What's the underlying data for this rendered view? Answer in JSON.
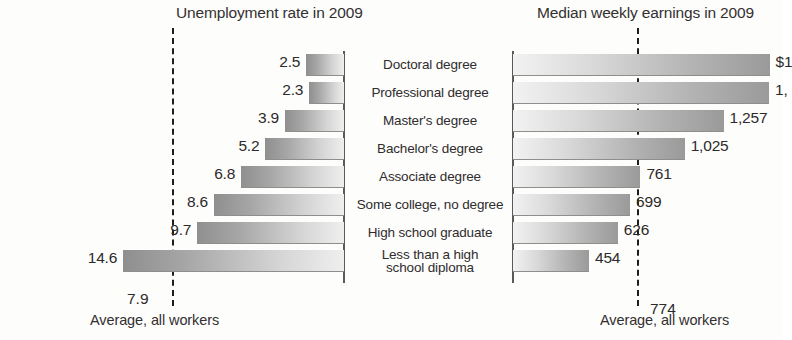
{
  "chart_data": [
    {
      "type": "bar",
      "title": "Unemployment rate in 2009",
      "orientation": "horizontal",
      "direction": "right-to-left",
      "xlabel": "",
      "ylabel": "",
      "grid": false,
      "legend": null,
      "xlim": [
        0,
        16
      ],
      "categories": [
        "Doctoral degree",
        "Professional degree",
        "Master's degree",
        "Bachelor's degree",
        "Associate degree",
        "Some college, no degree",
        "High school graduate",
        "Less than a high school diploma"
      ],
      "values": [
        2.5,
        2.3,
        3.9,
        5.2,
        6.8,
        8.6,
        9.7,
        14.6
      ],
      "value_labels": [
        "2.5",
        "2.3",
        "3.9",
        "5.2",
        "6.8",
        "8.6",
        "9.7",
        "14.6"
      ],
      "reference_line": {
        "value": 7.9,
        "label": "7.9",
        "caption": "Average, all workers",
        "style": "dashed"
      }
    },
    {
      "type": "bar",
      "title": "Median weekly earnings in 2009",
      "orientation": "horizontal",
      "direction": "left-to-right",
      "xlabel": "",
      "ylabel": "",
      "grid": false,
      "legend": null,
      "xlim": [
        0,
        1600
      ],
      "categories": [
        "Doctoral degree",
        "Professional degree",
        "Master's degree",
        "Bachelor's degree",
        "Associate degree",
        "Some college, no degree",
        "High school graduate",
        "Less than a high school diploma"
      ],
      "values": [
        1532,
        1529,
        1257,
        1025,
        761,
        699,
        626,
        454
      ],
      "value_labels": [
        "$1",
        "1,",
        "1,257",
        "1,025",
        "761",
        "699",
        "626",
        "454"
      ],
      "value_labels_note": "first two labels are clipped by the right edge of the screenshot",
      "reference_line": {
        "value": 774,
        "label": "774",
        "caption": "Average, all workers",
        "style": "dashed"
      }
    }
  ],
  "left_chart": {
    "title": "Unemployment rate in 2009",
    "bars": [
      {
        "label": "2.5",
        "value": 2.5
      },
      {
        "label": "2.3",
        "value": 2.3
      },
      {
        "label": "3.9",
        "value": 3.9
      },
      {
        "label": "5.2",
        "value": 5.2
      },
      {
        "label": "6.8",
        "value": 6.8
      },
      {
        "label": "8.6",
        "value": 8.6
      },
      {
        "label": "9.7",
        "value": 9.7
      },
      {
        "label": "14.6",
        "value": 14.6
      }
    ],
    "average_value": "7.9",
    "average_caption": "Average, all workers"
  },
  "right_chart": {
    "title": "Median weekly earnings in 2009",
    "bars": [
      {
        "label": "$1",
        "value": 1532
      },
      {
        "label": "1,",
        "value": 1529
      },
      {
        "label": "1,257",
        "value": 1257
      },
      {
        "label": "1,025",
        "value": 1025
      },
      {
        "label": "761",
        "value": 761
      },
      {
        "label": "699",
        "value": 699
      },
      {
        "label": "626",
        "value": 626
      },
      {
        "label": "454",
        "value": 454
      }
    ],
    "average_value": "774",
    "average_caption": "Average, all workers"
  },
  "categories": [
    "Doctoral degree",
    "Professional degree",
    "Master's degree",
    "Bachelor's degree",
    "Associate degree",
    "Some college, no degree",
    "High school graduate",
    "Less than a high\nschool diploma"
  ],
  "colors": {
    "bar_dark": "#8f8f8f",
    "bar_light": "#efefef",
    "axis": "#5a5a5a",
    "reference_line": "#1d1d1d",
    "text": "#2d2a2a",
    "background": "#fdfdfc"
  }
}
